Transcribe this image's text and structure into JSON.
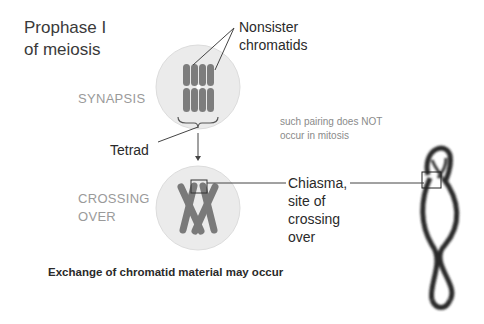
{
  "title": [
    "Prophase I",
    "of meiosis"
  ],
  "stages": {
    "synapsis": "SYNAPSIS",
    "crossing_over": [
      "CROSSING",
      "OVER"
    ]
  },
  "labels": {
    "nonsister": [
      "Nonsister",
      "chromatids"
    ],
    "tetrad": "Tetrad",
    "chiasma": [
      "Chiasma,",
      "site of",
      "crossing",
      "over"
    ]
  },
  "note": [
    "such pairing does NOT",
    "occur in mitosis"
  ],
  "caption": "Exchange of chromatid material may occur",
  "colors": {
    "cell_fill": "#ebebeb",
    "cell_stroke": "#d8d8d8",
    "chromatid": "#7a7a7a",
    "line": "#333333",
    "stage_text": "#9a9a9a",
    "micrograph": "#2b2b2b"
  }
}
